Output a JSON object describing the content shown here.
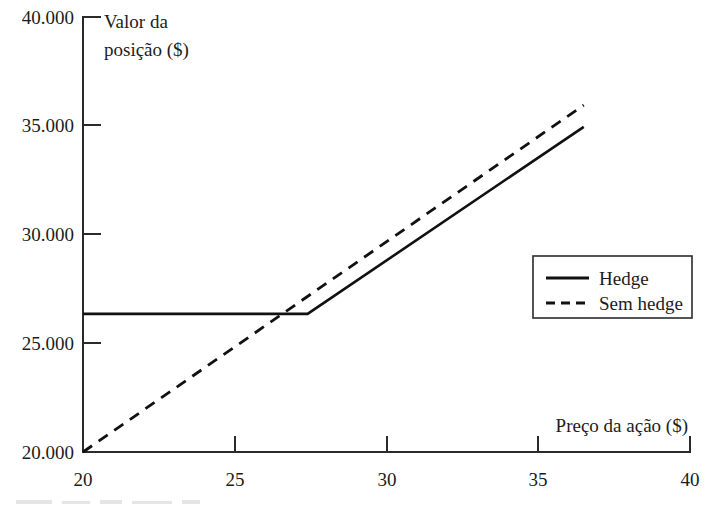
{
  "chart_data": {
    "type": "line",
    "title": "",
    "xlabel": "Preço da ação ($)",
    "ylabel": "Valor da posição ($)",
    "xlim": [
      20,
      40
    ],
    "ylim": [
      20000,
      40000
    ],
    "xticks": [
      20,
      25,
      30,
      35,
      40
    ],
    "yticks": [
      20000,
      25000,
      30000,
      35000,
      40000
    ],
    "xtick_labels": [
      "20",
      "25",
      "30",
      "35",
      "40"
    ],
    "ytick_labels": [
      "20.000",
      "25.000",
      "30.000",
      "35.000",
      "40.000"
    ],
    "grid": false,
    "legend_position": "center-right",
    "series": [
      {
        "name": "Hedge",
        "style": "solid",
        "color": "#111111",
        "x": [
          20,
          27.4,
          36.5
        ],
        "values": [
          26350,
          26350,
          34950
        ]
      },
      {
        "name": "Sem hedge",
        "style": "dashed",
        "color": "#111111",
        "x": [
          20,
          36.5
        ],
        "values": [
          20000,
          35950
        ]
      }
    ],
    "annotations": []
  },
  "axes": {
    "y_title_line1": "Valor da",
    "y_title_line2": "posição ($)",
    "x_title": "Preço da ação ($)"
  },
  "legend": {
    "items": [
      {
        "label": "Hedge",
        "style": "solid"
      },
      {
        "label": "Sem hedge",
        "style": "dashed"
      }
    ]
  },
  "colors": {
    "line": "#111111",
    "axis": "#2b2b2b",
    "text": "#1c1c1c",
    "background": "#ffffff"
  }
}
